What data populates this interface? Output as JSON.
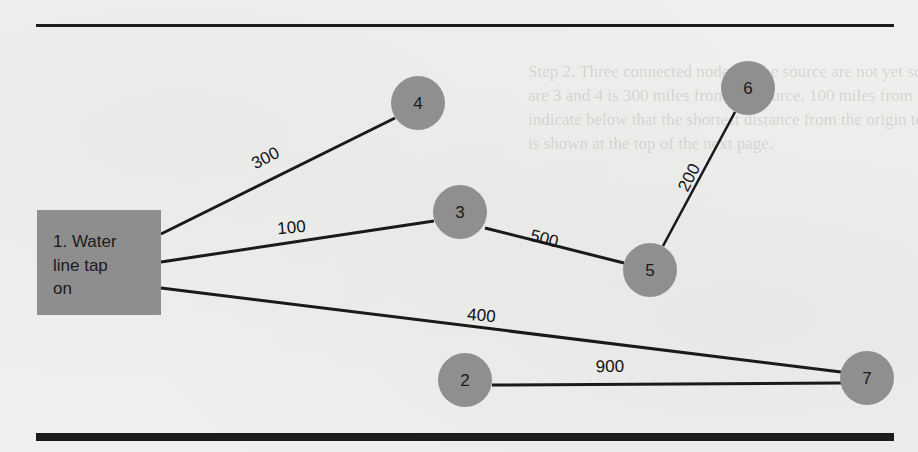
{
  "background_text": {
    "lines": [
      "Step 2. Three connected nodes to the source are not yet solved...",
      "are 3 and 4 is 300 miles from the source, 100 miles from 3; we know 5",
      "indicate below that the shortest distance from the origin to 5 is 600 miles",
      "is shown at the top of the next page."
    ]
  },
  "colors": {
    "rule": "#1c1c1c",
    "source_box_fill": "#8e8e8e",
    "node_fill": "#8f8f8f",
    "edge": "#1a1a1a",
    "text": "#1a1a1a",
    "page": "#efefed"
  },
  "source": {
    "id": "1",
    "label_lines": [
      "1.  Water",
      "line tap",
      "on"
    ],
    "x": 37,
    "y": 210,
    "width": 124,
    "height": 105
  },
  "nodes": [
    {
      "id": "2",
      "label": "2",
      "cx": 465,
      "cy": 380,
      "r": 27
    },
    {
      "id": "3",
      "label": "3",
      "cx": 460,
      "cy": 212,
      "r": 27
    },
    {
      "id": "4",
      "label": "4",
      "cx": 418,
      "cy": 103,
      "r": 27
    },
    {
      "id": "5",
      "label": "5",
      "cx": 650,
      "cy": 270,
      "r": 27
    },
    {
      "id": "6",
      "label": "6",
      "cx": 748,
      "cy": 88,
      "r": 27
    },
    {
      "id": "7",
      "label": "7",
      "cx": 867,
      "cy": 378,
      "r": 27
    }
  ],
  "edges": [
    {
      "from": "1",
      "to": "4",
      "distance": "300",
      "x1": 161,
      "y1": 234,
      "x2": 395,
      "y2": 118,
      "label_x": 268,
      "label_y": 163,
      "label_angle": -27
    },
    {
      "from": "1",
      "to": "3",
      "distance": "100",
      "x1": 161,
      "y1": 262,
      "x2": 434,
      "y2": 221,
      "label_x": 292,
      "label_y": 233,
      "label_angle": -5
    },
    {
      "from": "1",
      "to": "7",
      "distance": "400",
      "x1": 161,
      "y1": 288,
      "x2": 841,
      "y2": 372,
      "label_x": 481,
      "label_y": 321,
      "label_angle": 5
    },
    {
      "from": "3",
      "to": "5",
      "distance": "500",
      "x1": 485,
      "y1": 228,
      "x2": 624,
      "y2": 263,
      "label_x": 543,
      "label_y": 244,
      "label_angle": 14
    },
    {
      "from": "5",
      "to": "6",
      "distance": "200",
      "x1": 663,
      "y1": 246,
      "x2": 735,
      "y2": 112,
      "label_x": 694,
      "label_y": 180,
      "label_angle": -63
    },
    {
      "from": "2",
      "to": "7",
      "distance": "900",
      "x1": 492,
      "y1": 385,
      "x2": 841,
      "y2": 383,
      "label_x": 610,
      "label_y": 372,
      "label_angle": -1
    }
  ]
}
